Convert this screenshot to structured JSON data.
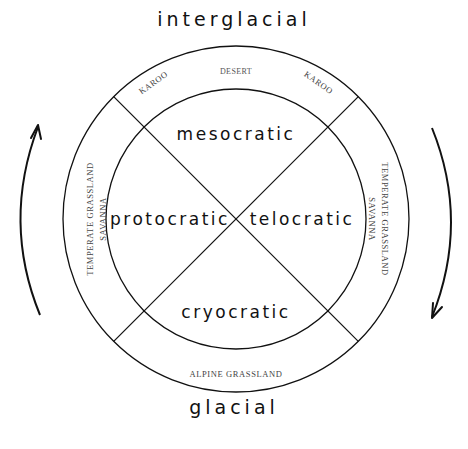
{
  "diagram": {
    "top_label": "interglacial",
    "bottom_label": "glacial",
    "inner_quadrants": {
      "top": "mesocratic",
      "left": "protocratic",
      "right": "telocratic",
      "bottom": "cryocratic"
    },
    "outer_ring": {
      "top_center": "DESERT",
      "top_left": "KAROO",
      "top_right": "KAROO",
      "left_line1": "TEMPERATE GRASSLAND",
      "left_line2": "SAVANNA",
      "right_line1": "TEMPERATE GRASSLAND",
      "right_line2": "SAVANNA",
      "bottom": "ALPINE GRASSLAND"
    },
    "arrows": {
      "left": "up-arrow",
      "right": "down-arrow"
    },
    "colors": {
      "line": "#111111",
      "background": "#ffffff",
      "biome_text": "#444444"
    }
  }
}
